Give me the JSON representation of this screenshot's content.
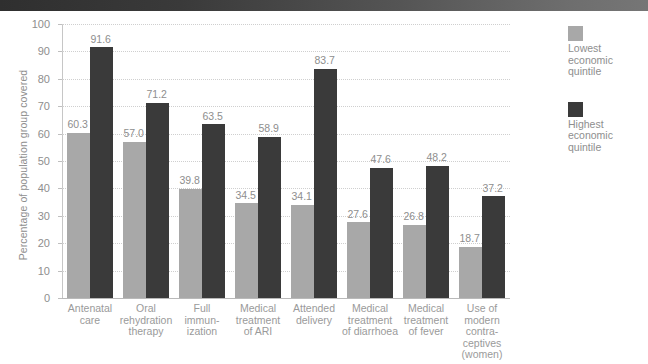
{
  "header": {
    "bar_name": "top-banner"
  },
  "legend": {
    "position": "right",
    "items": [
      {
        "label": "Lowest\neconomic\nquintile",
        "color": "#a8a8a8",
        "key": "lowest"
      },
      {
        "label": "Highest\neconomic\nquintile",
        "color": "#3a3a3a",
        "key": "highest"
      }
    ]
  },
  "chart_data": {
    "type": "bar",
    "title": "",
    "xlabel": "",
    "ylabel": "Percentage of population group covered",
    "ylim": [
      0,
      100
    ],
    "yticks": [
      0,
      10,
      20,
      30,
      40,
      50,
      60,
      70,
      80,
      90,
      100
    ],
    "grid": true,
    "legend_position": "right",
    "categories": [
      "Antenatal\ncare",
      "Oral\nrehydration\ntherapy",
      "Full\nimmun-\nization",
      "Medical\ntreatment\nof ARI",
      "Attended\ndelivery",
      "Medical\ntreatment\nof diarrhoea",
      "Medical\ntreatment\nof fever",
      "Use of\nmodern\ncontra-\nceptives\n(women)"
    ],
    "series": [
      {
        "name": "Lowest economic quintile",
        "color": "#a8a8a8",
        "values": [
          60.3,
          57.0,
          39.8,
          34.5,
          34.1,
          27.6,
          26.8,
          18.7
        ],
        "labels": [
          "60.3",
          "57.0",
          "39.8",
          "34.5",
          "34.1",
          "27.6",
          "26.8",
          "18.7"
        ]
      },
      {
        "name": "Highest economic quintile",
        "color": "#3a3a3a",
        "values": [
          91.6,
          71.2,
          63.5,
          58.9,
          83.7,
          47.6,
          48.2,
          37.2
        ],
        "labels": [
          "91.6",
          "71.2",
          "63.5",
          "58.9",
          "83.7",
          "47.6",
          "48.2",
          "37.2"
        ]
      }
    ]
  }
}
